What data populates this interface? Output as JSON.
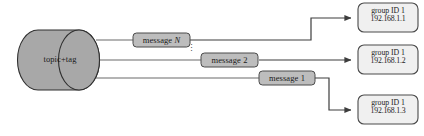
{
  "figure": {
    "type": "diagram",
    "background_color": "#ffffff",
    "shape_fill": "#a8a8a8",
    "box_fill": "#bdbdbd",
    "group_box_fill": "#f0f0f0",
    "stroke_color": "#4a4a4a",
    "text_color": "#1a1a1a"
  },
  "source": {
    "name": "topic-tag-cylinder",
    "label": "topic+tag"
  },
  "messages": [
    {
      "name": "message-n-box",
      "label": "message N",
      "italic_suffix": "N"
    },
    {
      "name": "message-2-box",
      "label": "message 2"
    },
    {
      "name": "message-1-box",
      "label": "message 1"
    }
  ],
  "ellipsis": {
    "name": "vertical-ellipsis",
    "glyph": "⋮"
  },
  "consumers": [
    {
      "name": "group-box-1",
      "group": "group ID 1",
      "ip": "192.168.1.1"
    },
    {
      "name": "group-box-2",
      "group": "group ID 1",
      "ip": "192.168.1.2"
    },
    {
      "name": "group-box-3",
      "group": "group ID 1",
      "ip": "192.168.1.3"
    }
  ],
  "caption": {
    "text": ""
  }
}
